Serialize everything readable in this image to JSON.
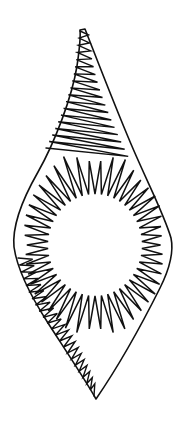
{
  "artwork": {
    "title": "Zigzag-filled leaf form with circular void",
    "subject": "leaf-paisley-silhouette",
    "style": "black-ink-line-drawing",
    "background_color": "#ffffff",
    "stroke_color": "#111111",
    "fill_color": "#ffffff",
    "stroke_width_px": 1.5,
    "canvas": {
      "width": 186,
      "height": 433
    },
    "elements": [
      {
        "name": "outer-outline",
        "description": "Leaf / flame silhouette, narrow stem at top, bulging middle, pointed base"
      },
      {
        "name": "inner-void",
        "description": "White oval opening at the center of the leaf"
      },
      {
        "name": "zigzag-fill",
        "description": "Continuous sawtooth stroke filling the band between outline and void"
      }
    ]
  },
  "geometry": {
    "outer_outline": {
      "top_tip": [
        83,
        29
      ],
      "bottom_tip": [
        95,
        400
      ],
      "leftmost": [
        14,
        246
      ],
      "rightmost": [
        172,
        238
      ],
      "path": "M 85 29 C 96 57 114 104 131 144 C 148 184 164 214 171 238 C 174 252 170 268 160 288 C 145 318 120 364 96 399 C 86 381 66 351 48 323 C 30 295 17 268 14 247 C 12 226 22 200 38 172 C 55 142 72 97 77 66 C 79 52 81 39 80 30 Z"
    },
    "inner_void": {
      "center": [
        95,
        245
      ],
      "rx": 46,
      "ry": 50,
      "path": "M 95 195 C 120 195 141 217 141 245 C 141 273 120 295 95 295 C 70 295 49 273 49 245 C 49 217 70 195 95 195 Z"
    },
    "zigzag_ray_band": {
      "description": "Radial sawtooth teeth emanating outward from the inner void toward the outer outline",
      "tooth_count": 46,
      "inner_radius_x": 47,
      "inner_radius_y": 51
    },
    "zigzag_stem_band": {
      "description": "Tight zigzag filling the narrow upper stem",
      "tooth_count": 17
    },
    "zigzag_lower_left_band": {
      "description": "Dense overlapping zigzag along the lower-left boundary",
      "tooth_count": 22
    }
  }
}
